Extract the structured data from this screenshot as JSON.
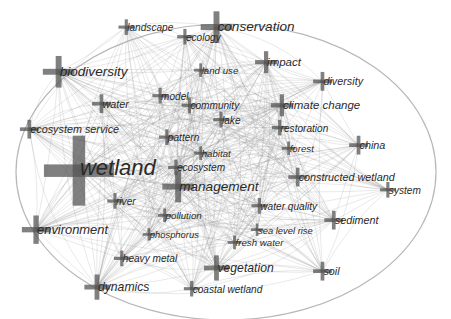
{
  "diagram": {
    "type": "keyword co-occurrence network",
    "nodes": [
      {
        "id": "wetland",
        "label": "wetland",
        "weight": 10,
        "x": 0.175,
        "y": 0.535
      },
      {
        "id": "conservation",
        "label": "conservation",
        "weight": 4,
        "x": 0.48,
        "y": 0.085
      },
      {
        "id": "biodiversity",
        "label": "biodiversity",
        "weight": 4,
        "x": 0.13,
        "y": 0.225
      },
      {
        "id": "management",
        "label": "management",
        "weight": 4,
        "x": 0.395,
        "y": 0.585
      },
      {
        "id": "environment",
        "label": "environment",
        "weight": 3.5,
        "x": 0.08,
        "y": 0.72
      },
      {
        "id": "dynamics",
        "label": "dynamics",
        "weight": 3,
        "x": 0.215,
        "y": 0.9
      },
      {
        "id": "vegetation",
        "label": "vegetation",
        "weight": 3,
        "x": 0.48,
        "y": 0.84
      },
      {
        "id": "climate-change",
        "label": "climate change",
        "weight": 2.5,
        "x": 0.625,
        "y": 0.33
      },
      {
        "id": "impact",
        "label": "impact",
        "weight": 2.5,
        "x": 0.59,
        "y": 0.195
      },
      {
        "id": "diversity",
        "label": "diversity",
        "weight": 2,
        "x": 0.715,
        "y": 0.255
      },
      {
        "id": "ecosystem-service",
        "label": "ecosystem service",
        "weight": 2,
        "x": 0.065,
        "y": 0.405
      },
      {
        "id": "constructed-wetland",
        "label": "constructed wetland",
        "weight": 2,
        "x": 0.66,
        "y": 0.555
      },
      {
        "id": "water",
        "label": "water",
        "weight": 2,
        "x": 0.225,
        "y": 0.325
      },
      {
        "id": "sediment",
        "label": "sediment",
        "weight": 2,
        "x": 0.74,
        "y": 0.69
      },
      {
        "id": "china",
        "label": "china",
        "weight": 2,
        "x": 0.795,
        "y": 0.455
      },
      {
        "id": "soil",
        "label": "soil",
        "weight": 2,
        "x": 0.715,
        "y": 0.85
      },
      {
        "id": "system",
        "label": "system",
        "weight": 1.5,
        "x": 0.86,
        "y": 0.595
      },
      {
        "id": "restoration",
        "label": "restoration",
        "weight": 1.5,
        "x": 0.62,
        "y": 0.4
      },
      {
        "id": "ecology",
        "label": "ecology",
        "weight": 1.5,
        "x": 0.41,
        "y": 0.115
      },
      {
        "id": "landscape",
        "label": "landscape",
        "weight": 1.5,
        "x": 0.28,
        "y": 0.085
      },
      {
        "id": "community",
        "label": "community",
        "weight": 1.5,
        "x": 0.42,
        "y": 0.33
      },
      {
        "id": "model",
        "label": "model",
        "weight": 1.5,
        "x": 0.355,
        "y": 0.3
      },
      {
        "id": "lake",
        "label": "lake",
        "weight": 1.5,
        "x": 0.49,
        "y": 0.375
      },
      {
        "id": "pattern",
        "label": "pattern",
        "weight": 1.5,
        "x": 0.37,
        "y": 0.43
      },
      {
        "id": "habitat",
        "label": "habitat",
        "weight": 1.2,
        "x": 0.445,
        "y": 0.48
      },
      {
        "id": "ecosystem",
        "label": "ecosystem",
        "weight": 1.5,
        "x": 0.39,
        "y": 0.525
      },
      {
        "id": "forest",
        "label": "forest",
        "weight": 1.2,
        "x": 0.64,
        "y": 0.465
      },
      {
        "id": "land-use",
        "label": "land use",
        "weight": 1.2,
        "x": 0.445,
        "y": 0.22
      },
      {
        "id": "river",
        "label": "river",
        "weight": 1.5,
        "x": 0.255,
        "y": 0.63
      },
      {
        "id": "water-quality",
        "label": "water quality",
        "weight": 1.5,
        "x": 0.575,
        "y": 0.645
      },
      {
        "id": "pollution",
        "label": "pollution",
        "weight": 1.2,
        "x": 0.365,
        "y": 0.675
      },
      {
        "id": "phosphorus",
        "label": "phosphorus",
        "weight": 1,
        "x": 0.33,
        "y": 0.735
      },
      {
        "id": "sea-level-rise",
        "label": "sea level rise",
        "weight": 1,
        "x": 0.57,
        "y": 0.72
      },
      {
        "id": "fresh-water",
        "label": "fresh water",
        "weight": 1.2,
        "x": 0.52,
        "y": 0.76
      },
      {
        "id": "heavy-metal",
        "label": "heavy metal",
        "weight": 1.5,
        "x": 0.27,
        "y": 0.81
      },
      {
        "id": "coastal-wetland",
        "label": "coastal wetland",
        "weight": 1.5,
        "x": 0.425,
        "y": 0.905
      }
    ],
    "hub_links": [
      "wetland",
      "conservation",
      "biodiversity",
      "management",
      "environment",
      "dynamics",
      "vegetation",
      "climate-change",
      "impact",
      "ecosystem-service"
    ],
    "colors": {
      "edge": "#8a8a8a",
      "node": "#555555",
      "label": "#2a2a2a",
      "background": "#ffffff"
    }
  }
}
